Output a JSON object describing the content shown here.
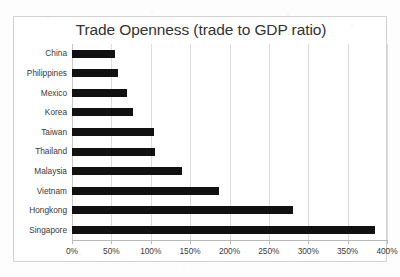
{
  "chart_data": {
    "type": "bar",
    "orientation": "horizontal",
    "title": "Trade Openness (trade to GDP ratio)",
    "xlabel": "",
    "ylabel": "",
    "categories": [
      "China",
      "Philippines",
      "Mexico",
      "Korea",
      "Taiwan",
      "Thailand",
      "Malaysia",
      "Vietnam",
      "Hongkong",
      "Singapore"
    ],
    "values": [
      55,
      58,
      70,
      77,
      104,
      105,
      140,
      187,
      281,
      385
    ],
    "value_unit": "%",
    "xlim": [
      0,
      400
    ],
    "xticks": [
      0,
      50,
      100,
      150,
      200,
      250,
      300,
      350,
      400
    ],
    "xtick_labels": [
      "0%",
      "50%",
      "100%",
      "150%",
      "200%",
      "250%",
      "300%",
      "350%",
      "400%"
    ],
    "grid": "vertical",
    "legend": "none",
    "bar_color": "#111111",
    "gridline_color": "#dcdcdc",
    "background_color": "#ffffff",
    "text_color": "#3a3a3a"
  }
}
